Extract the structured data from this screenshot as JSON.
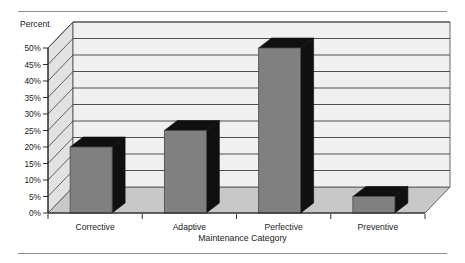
{
  "chart_data": {
    "type": "bar",
    "title": "",
    "subtitle": "",
    "xlabel": "Maintenance Category",
    "ylabel": "Percent",
    "unit_label": "Percent",
    "categories": [
      "Corrective",
      "Adaptive",
      "Perfective",
      "Preventive"
    ],
    "values": [
      20,
      25,
      50,
      5
    ],
    "value_labels": [
      "20%",
      "25%",
      "50%",
      "5%"
    ],
    "ylim": [
      0,
      50
    ],
    "ytick_values": [
      0,
      5,
      10,
      15,
      20,
      25,
      30,
      35,
      40,
      45,
      50
    ],
    "ytick_labels": [
      "0%",
      "5%",
      "10%",
      "15%",
      "20%",
      "25%",
      "30%",
      "35%",
      "40%",
      "45%",
      "50%"
    ],
    "grid": true,
    "grid_axis": "y",
    "legend": false,
    "legend_position": "none",
    "style": "3d-bar",
    "colors": {
      "bar_front": "#808080",
      "bar_side": "#101010",
      "bar_top": "#101010",
      "wall_back": "#f0f0f0",
      "wall_left": "#e2e2e2",
      "floor": "#c8c8c8",
      "gridline": "#3c3c3c",
      "outline": "#585858",
      "text": "#1a1a1a",
      "rule": "#8d8d8d"
    }
  },
  "figure": {
    "rule_top": "horizontal-rule",
    "rule_bottom": "horizontal-rule"
  }
}
